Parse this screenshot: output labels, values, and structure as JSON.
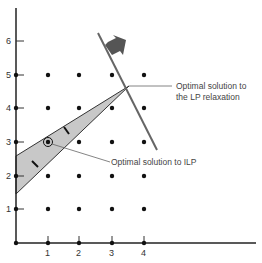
{
  "diagram": {
    "type": "integer-linear-programming-graphical",
    "x_ticks": [
      "1",
      "2",
      "3",
      "4"
    ],
    "y_ticks": [
      "1",
      "2",
      "3",
      "4",
      "5",
      "6"
    ],
    "annotations": {
      "lp_relaxation_line1": "Optimal solution to",
      "lp_relaxation_line2": "the LP relaxation",
      "ilp": "Optimal solution to ILP"
    },
    "colors": {
      "feasible_region": "#c8c8c8",
      "objective_line": "#555555",
      "arrow": "#555555",
      "axis": "#222222"
    },
    "lp_optimum": [
      3.5,
      4.7
    ],
    "ilp_optimum": [
      1,
      3
    ],
    "lattice_points": "x in 0..4, y in 0..5"
  }
}
